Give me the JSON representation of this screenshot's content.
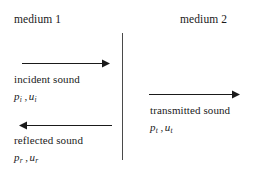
{
  "diagram": {
    "background_color": "#ffffff",
    "line_color": "#1a1a1a",
    "interface_color": "#4a4a4a",
    "media": [
      {
        "id": "medium-1",
        "label": "medium 1"
      },
      {
        "id": "medium-2",
        "label": "medium 2"
      }
    ],
    "waves": [
      {
        "id": "incident",
        "caption": "incident sound",
        "pressure_symbol": "p",
        "velocity_symbol": "u",
        "subscript": "i",
        "separator": ",",
        "direction": "right"
      },
      {
        "id": "transmitted",
        "caption": "transmitted sound",
        "pressure_symbol": "p",
        "velocity_symbol": "u",
        "subscript": "t",
        "separator": ",",
        "direction": "right"
      },
      {
        "id": "reflected",
        "caption": "reflected sound",
        "pressure_symbol": "p",
        "velocity_symbol": "u",
        "subscript": "r",
        "separator": ",",
        "direction": "left"
      }
    ]
  }
}
